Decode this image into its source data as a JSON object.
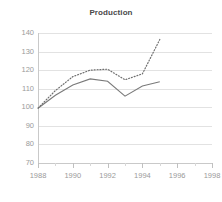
{
  "chart_data": {
    "type": "line",
    "title": "Production",
    "xlabel": "",
    "ylabel": "",
    "xlim": [
      1988,
      1998
    ],
    "ylim": [
      70,
      140
    ],
    "grid": true,
    "legend": "none",
    "x_ticks": [
      1988,
      1990,
      1992,
      1994,
      1996,
      1998
    ],
    "x_tick_labels": [
      "1988",
      "1990",
      "1992",
      "1994",
      "1996",
      "1998"
    ],
    "x_minor_ticks": [
      1989,
      1991,
      1993,
      1995,
      1997
    ],
    "y_ticks": [
      70,
      80,
      90,
      100,
      110,
      120,
      130,
      140
    ],
    "y_tick_labels": [
      "70",
      "80",
      "90",
      "100",
      "110",
      "120",
      "130",
      "140"
    ],
    "x": [
      1988,
      1989,
      1990,
      1991,
      1992,
      1993,
      1994,
      1995
    ],
    "series": [
      {
        "name": "solid-series",
        "style": "solid",
        "color": "#7a7a7a",
        "values": [
          99.5,
          106.5,
          112.0,
          115.3,
          114.0,
          106.0,
          111.5,
          113.8
        ]
      },
      {
        "name": "dotted-series",
        "style": "dotted",
        "color": "#6f6f6f",
        "values": [
          99.5,
          109.0,
          116.5,
          120.0,
          120.5,
          114.8,
          118.0,
          136.5
        ]
      }
    ]
  },
  "axis": {
    "y_labels": [
      "140",
      "130",
      "120",
      "110",
      "100",
      "90",
      "80",
      "70"
    ],
    "x_labels": [
      "1988",
      "1990",
      "1992",
      "1994",
      "1996",
      "1998"
    ]
  }
}
